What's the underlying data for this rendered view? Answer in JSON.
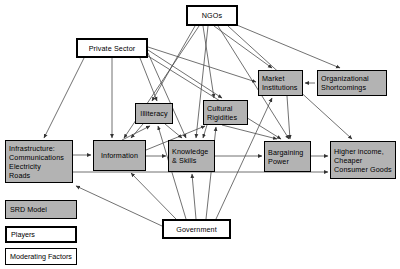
{
  "diagram": {
    "colors": {
      "node_fill_moderating": "#b3b3b3",
      "node_fill_player": "#ffffff",
      "border": "#000000",
      "background": "#ffffff",
      "edge": "#4d4d4d"
    },
    "nodes": [
      {
        "id": "ngos",
        "label": "NGOs",
        "type": "player",
        "x": 186,
        "y": 5,
        "w": 52,
        "h": 21,
        "align": "center"
      },
      {
        "id": "private",
        "label": "Private Sector",
        "type": "player",
        "x": 76,
        "y": 38,
        "w": 72,
        "h": 20,
        "align": "center"
      },
      {
        "id": "government",
        "label": "Government",
        "type": "player",
        "x": 162,
        "y": 219,
        "w": 69,
        "h": 20,
        "align": "center"
      },
      {
        "id": "market",
        "label": "Market\nInstitutions",
        "type": "moderating",
        "x": 258,
        "y": 70,
        "w": 45,
        "h": 26,
        "align": "left"
      },
      {
        "id": "organizational",
        "label": "Organizational\nShortcomings",
        "type": "moderating",
        "x": 317,
        "y": 70,
        "w": 70,
        "h": 26,
        "align": "left"
      },
      {
        "id": "illiteracy",
        "label": "Illiteracy",
        "type": "moderating",
        "x": 135,
        "y": 103,
        "w": 38,
        "h": 21,
        "align": "center"
      },
      {
        "id": "cultural",
        "label": "Cultural\nRigidities",
        "type": "moderating",
        "x": 203,
        "y": 100,
        "w": 45,
        "h": 25,
        "align": "left"
      },
      {
        "id": "infrastructure",
        "label": "Infrastructure:\n Communications\n Electricity\n Roads",
        "type": "moderating",
        "x": 5,
        "y": 140,
        "w": 68,
        "h": 43,
        "align": "left"
      },
      {
        "id": "information",
        "label": "Information",
        "type": "moderating",
        "x": 93,
        "y": 140,
        "w": 53,
        "h": 31,
        "align": "center"
      },
      {
        "id": "knowledge",
        "label": "Knowledge\n& Skills",
        "type": "moderating",
        "x": 168,
        "y": 140,
        "w": 47,
        "h": 32,
        "align": "left"
      },
      {
        "id": "bargaining",
        "label": "Bargaining\nPower",
        "type": "moderating",
        "x": 264,
        "y": 141,
        "w": 47,
        "h": 31,
        "align": "left"
      },
      {
        "id": "higher",
        "label": "Higher income,\nCheaper\nConsumer Goods",
        "type": "moderating",
        "x": 330,
        "y": 141,
        "w": 66,
        "h": 38,
        "align": "left"
      }
    ],
    "legend": {
      "items": [
        {
          "id": "legend-srd",
          "label": "SRD Model",
          "type": "moderating",
          "x": 5,
          "y": 200,
          "w": 72,
          "h": 19
        },
        {
          "id": "legend-players",
          "label": "Players",
          "type": "player",
          "x": 5,
          "y": 226,
          "w": 72,
          "h": 17
        },
        {
          "id": "legend-moderating",
          "label": "Moderating Factors",
          "type": "plain",
          "x": 5,
          "y": 248,
          "w": 72,
          "h": 17
        }
      ]
    },
    "edges": [
      {
        "from": "ngos",
        "to": "illiteracy",
        "x1": 195,
        "y1": 26,
        "x2": 152,
        "y2": 101
      },
      {
        "from": "ngos",
        "to": "cultural",
        "x1": 203,
        "y1": 26,
        "x2": 214,
        "y2": 98
      },
      {
        "from": "ngos",
        "to": "information",
        "x1": 199,
        "y1": 26,
        "x2": 124,
        "y2": 138
      },
      {
        "from": "ngos",
        "to": "knowledge",
        "x1": 208,
        "y1": 26,
        "x2": 196,
        "y2": 138
      },
      {
        "from": "ngos",
        "to": "market",
        "x1": 214,
        "y1": 26,
        "x2": 272,
        "y2": 68
      },
      {
        "from": "ngos",
        "to": "bargaining",
        "x1": 218,
        "y1": 26,
        "x2": 289,
        "y2": 139
      },
      {
        "from": "ngos",
        "to": "higher",
        "x1": 228,
        "y1": 26,
        "x2": 352,
        "y2": 139
      },
      {
        "from": "ngos",
        "to": "organizational",
        "x1": 232,
        "y1": 23,
        "x2": 340,
        "y2": 68
      },
      {
        "from": "private",
        "to": "infrastructure",
        "x1": 84,
        "y1": 58,
        "x2": 44,
        "y2": 138
      },
      {
        "from": "private",
        "to": "information",
        "x1": 112,
        "y1": 58,
        "x2": 112,
        "y2": 138
      },
      {
        "from": "private",
        "to": "illiteracy",
        "x1": 140,
        "y1": 58,
        "x2": 157,
        "y2": 101
      },
      {
        "from": "private",
        "to": "market",
        "x1": 148,
        "y1": 47,
        "x2": 256,
        "y2": 82
      },
      {
        "from": "private",
        "to": "cultural",
        "x1": 148,
        "y1": 50,
        "x2": 222,
        "y2": 98
      },
      {
        "from": "private",
        "to": "knowledge",
        "x1": 148,
        "y1": 53,
        "x2": 186,
        "y2": 138
      },
      {
        "from": "private",
        "to": "bargaining",
        "x1": 148,
        "y1": 56,
        "x2": 281,
        "y2": 139
      },
      {
        "from": "government",
        "to": "information",
        "x1": 176,
        "y1": 219,
        "x2": 131,
        "y2": 173
      },
      {
        "from": "government",
        "to": "illiteracy",
        "x1": 186,
        "y1": 219,
        "x2": 158,
        "y2": 126
      },
      {
        "from": "government",
        "to": "knowledge",
        "x1": 196,
        "y1": 219,
        "x2": 192,
        "y2": 174
      },
      {
        "from": "government",
        "to": "cultural",
        "x1": 206,
        "y1": 219,
        "x2": 216,
        "y2": 127
      },
      {
        "from": "government",
        "to": "market",
        "x1": 216,
        "y1": 219,
        "x2": 272,
        "y2": 98
      },
      {
        "from": "government",
        "to": "infrastructure",
        "x1": 162,
        "y1": 226,
        "x2": 76,
        "y2": 186
      },
      {
        "from": "organizational",
        "to": "market",
        "x1": 315,
        "y1": 83,
        "x2": 305,
        "y2": 83
      },
      {
        "from": "market",
        "to": "bargaining",
        "x1": 287,
        "y1": 96,
        "x2": 290,
        "y2": 139
      },
      {
        "from": "infrastructure",
        "to": "information",
        "x1": 73,
        "y1": 155,
        "x2": 91,
        "y2": 155
      },
      {
        "from": "infrastructure",
        "to": "higher",
        "x1": 73,
        "y1": 172,
        "x2": 328,
        "y2": 172
      },
      {
        "from": "information",
        "to": "knowledge",
        "x1": 146,
        "y1": 156,
        "x2": 166,
        "y2": 156
      },
      {
        "from": "information",
        "to": "cultural",
        "x1": 146,
        "y1": 150,
        "x2": 205,
        "y2": 126
      },
      {
        "from": "knowledge",
        "to": "bargaining",
        "x1": 215,
        "y1": 156,
        "x2": 262,
        "y2": 156
      },
      {
        "from": "bargaining",
        "to": "higher",
        "x1": 311,
        "y1": 156,
        "x2": 328,
        "y2": 156
      },
      {
        "from": "illiteracy",
        "to": "information",
        "x1": 143,
        "y1": 124,
        "x2": 131,
        "y2": 138
      },
      {
        "from": "illiteracy",
        "to": "knowledge",
        "x1": 165,
        "y1": 124,
        "x2": 182,
        "y2": 138
      },
      {
        "from": "cultural",
        "to": "bargaining",
        "x1": 222,
        "y1": 125,
        "x2": 277,
        "y2": 139
      },
      {
        "from": "cultural",
        "to": "knowledge",
        "x1": 207,
        "y1": 125,
        "x2": 203,
        "y2": 138
      },
      {
        "from": "information",
        "to": "illiteracy",
        "x1": 122,
        "y1": 140,
        "x2": 150,
        "y2": 126
      }
    ]
  }
}
